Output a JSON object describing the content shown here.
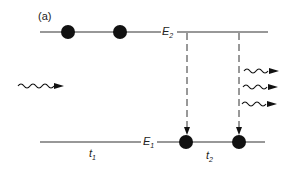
{
  "panel_label": "(a)",
  "levels": {
    "upper": {
      "name": "E",
      "sub": "2"
    },
    "lower": {
      "name": "E",
      "sub": "1"
    }
  },
  "times": {
    "t1": {
      "name": "t",
      "sub": "1"
    },
    "t2": {
      "name": "t",
      "sub": "2"
    }
  },
  "colors": {
    "ink": "#111111",
    "line": "#333333"
  }
}
